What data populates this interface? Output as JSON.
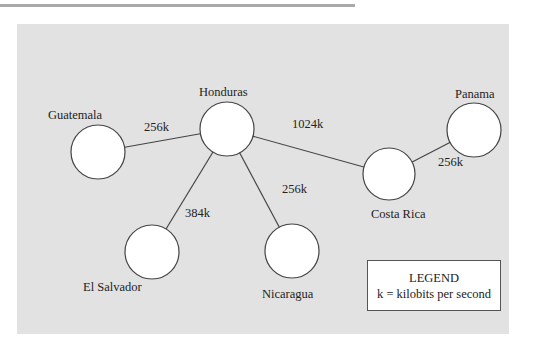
{
  "diagram": {
    "nodes": [
      {
        "id": "guatemala",
        "label": "Guatemala",
        "cx": 98,
        "cy": 152,
        "r": 27,
        "lx": 48,
        "ly": 108
      },
      {
        "id": "honduras",
        "label": "Honduras",
        "cx": 227,
        "cy": 129,
        "r": 27,
        "lx": 199,
        "ly": 85
      },
      {
        "id": "el_salvador",
        "label": "El Salvador",
        "cx": 152,
        "cy": 252,
        "r": 27,
        "lx": 83,
        "ly": 280
      },
      {
        "id": "nicaragua",
        "label": "Nicaragua",
        "cx": 292,
        "cy": 251,
        "r": 27,
        "lx": 262,
        "ly": 287
      },
      {
        "id": "costa_rica",
        "label": "Costa Rica",
        "cx": 389,
        "cy": 174,
        "r": 26,
        "lx": 371,
        "ly": 207
      },
      {
        "id": "panama",
        "label": "Panama",
        "cx": 474,
        "cy": 130,
        "r": 27,
        "lx": 455,
        "ly": 87
      }
    ],
    "edges": [
      {
        "from": "guatemala",
        "to": "honduras",
        "label": "256k",
        "lx": 144,
        "ly": 120
      },
      {
        "from": "honduras",
        "to": "el_salvador",
        "label": "384k",
        "lx": 185,
        "ly": 206
      },
      {
        "from": "honduras",
        "to": "nicaragua",
        "label": "256k",
        "lx": 282,
        "ly": 182
      },
      {
        "from": "honduras",
        "to": "costa_rica",
        "label": "1024k",
        "lx": 292,
        "ly": 117
      },
      {
        "from": "costa_rica",
        "to": "panama",
        "label": "256k",
        "lx": 438,
        "ly": 155
      }
    ]
  },
  "legend": {
    "title": "LEGEND",
    "text": "k = kilobits per second"
  },
  "colors": {
    "panel": "#e2e2e2",
    "node_fill": "#ffffff",
    "stroke": "#444444"
  }
}
